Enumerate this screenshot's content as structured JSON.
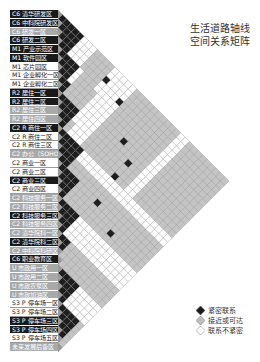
{
  "title": {
    "line1": "生活道路轴线",
    "line2": "空间关系矩阵"
  },
  "legend": [
    {
      "key": "B",
      "label": "紧密联系",
      "color": "#1a1a1a"
    },
    {
      "key": "G",
      "label": "接近或可达",
      "color": "#bdbdbd"
    },
    {
      "key": "W",
      "label": "联系不紧密",
      "color": "#ffffff"
    }
  ],
  "zones": [
    {
      "label": "C6 清华研发区",
      "tone": "black"
    },
    {
      "label": "C6 中科院研发区",
      "tone": "black"
    },
    {
      "label": "C6 研发一区",
      "tone": "gray"
    },
    {
      "label": "C6 研发二区",
      "tone": "black"
    },
    {
      "label": "M1 产业示范区",
      "tone": "black"
    },
    {
      "label": "M1 软件园区",
      "tone": "black"
    },
    {
      "label": "M1 芯片园区",
      "tone": "white"
    },
    {
      "label": "M1 企业孵化一区",
      "tone": "white"
    },
    {
      "label": "M1 企业孵化二区",
      "tone": "white"
    },
    {
      "label": "R2 居住一区",
      "tone": "black"
    },
    {
      "label": "R2 居住二区",
      "tone": "black"
    },
    {
      "label": "R2 居住三区",
      "tone": "gray"
    },
    {
      "label": "R2 居住四区",
      "tone": "gray"
    },
    {
      "label": "C2 R 商住一区",
      "tone": "black"
    },
    {
      "label": "C2 R 商住二区",
      "tone": "white"
    },
    {
      "label": "C2 R 商住三区",
      "tone": "white"
    },
    {
      "label": "C2 办公（SOHO）区",
      "tone": "gray"
    },
    {
      "label": "C2 商业一区",
      "tone": "white"
    },
    {
      "label": "C2 商业二区",
      "tone": "white"
    },
    {
      "label": "C2 商业三区",
      "tone": "black"
    },
    {
      "label": "C2 商业四区",
      "tone": "white"
    },
    {
      "label": "C2 科技服务一区",
      "tone": "gray"
    },
    {
      "label": "C2 科技服务二区",
      "tone": "gray"
    },
    {
      "label": "C2 科技服务三区",
      "tone": "black"
    },
    {
      "label": "C2 科技服务四区",
      "tone": "gray"
    },
    {
      "label": "C2 清华院科一区",
      "tone": "gray"
    },
    {
      "label": "C2 清华院科二区",
      "tone": "black"
    },
    {
      "label": "C2 中科院科研区",
      "tone": "gray"
    },
    {
      "label": "C6 职业教育区",
      "tone": "black"
    },
    {
      "label": "U 市政用一区",
      "tone": "gray"
    },
    {
      "label": "U 市政用二区",
      "tone": "gray"
    },
    {
      "label": "U 市政农泵区",
      "tone": "gray"
    },
    {
      "label": "U 市政加油区",
      "tone": "gray"
    },
    {
      "label": "S3 P 停车场一区",
      "tone": "white"
    },
    {
      "label": "S3 P 停车场二区",
      "tone": "white"
    },
    {
      "label": "S3 P 停车场三区",
      "tone": "black"
    },
    {
      "label": "S3 P 停车场四区",
      "tone": "black"
    },
    {
      "label": "S3 P 停车场五区",
      "tone": "white"
    },
    {
      "label": "未来发展后备区",
      "tone": "gray"
    }
  ],
  "matrix": {
    "layout": "rotated upper-triangular",
    "rows": [
      "BBBBBWWWGGGGWWWWWGGGGGGGGGGWWGGGGGGGGG",
      "BBBBWWWGGGGWWWWWGGGGGGGGGGWWGGGGGGGGG",
      "BBBWWWGGGGBWWWWGGGGGGGGGGWWGGGGGGGGG",
      "BBWWWGGGGWWWWBGGGGGGGGGGWWGGGGGGGGG",
      "BBBBWGGGWWWWWGGGGGGGGGGWWGGGGGGGGG",
      "BBBWGGGGWWWWGGGGGGGGGGWWGGGGGGGGG",
      "BBWGGGGWWWWGGGGGGGGGGWWGGGGGGGGG",
      "BBGGGGWWWWGGGGBGGGGGWWGGGGGGGGG",
      "BGGGGWWWWGGGGGGGGGGWWGGGGGGGGG",
      "BBBBWWWWGGGGGGGBGGWWGGGGGGGGG",
      "BBBWWWWGGGGGGGGGGWWGGGGGGGGG",
      "BBGWWWGGGGGGGGGGWWGGGGGGGGG",
      "BGWWWGGGGGGGBGGWWGGGGGGGGG",
      "BBBBBWWWWWWWWWWWWWWWWWWWW",
      "BBBBWWWWWWWWWWWWWWWWWWWW",
      "BBBGGGGGGGGGGGGGGGGGGGG",
      "BBGGGGGGGGGGGGGGGGGGGG",
      "BBBBGGGGBGGGGGGGGGGGG",
      "BBBGGGGGGGGGGGGGGGGG",
      "BBGGGGGGGGGBGGGGGGG",
      "BGGGGGGGGGGGGGGGGG",
      "BBBBWWWWWWWWWWWWW",
      "BBBWWWWWWWWWWWWW",
      "BBWWWWWWWWWWWWW",
      "BWWWWWWWWWWWWW",
      "BBGGGGGGGGGGG",
      "BGGGGGGGGGGG",
      "GGGGGGGGGGG",
      "GGGGGGGGGG",
      "BBBBWWWWW",
      "BBBWWWWW",
      "BBWWWWW",
      "BWWWWW",
      "BBBBG",
      "BBBG",
      "BBG",
      "BG",
      "G"
    ]
  }
}
